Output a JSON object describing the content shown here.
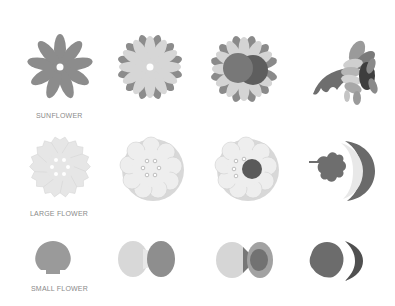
{
  "rows": [
    {
      "label": "SUNFLOWER",
      "steps": [
        "single-petal-layer",
        "two-petal-layers",
        "petals-with-center-discs",
        "assembled-side-view"
      ]
    },
    {
      "label": "LARGE FLOWER",
      "steps": [
        "single-scalloped-layer",
        "stacked-scalloped-layers",
        "layers-with-center-disc",
        "assembled-with-leaf"
      ]
    },
    {
      "label": "SMALL FLOWER",
      "steps": [
        "single-shell-piece",
        "two-shell-pieces",
        "shell-with-inner-piece",
        "assembled-side-view"
      ]
    }
  ],
  "colors": {
    "background": "#ffffff",
    "dark_gray": "#7a7a7a",
    "mid_gray": "#9a9a9a",
    "light_gray": "#d9d9d9",
    "paper_white": "#ececec",
    "label": "#8a8a8a"
  }
}
